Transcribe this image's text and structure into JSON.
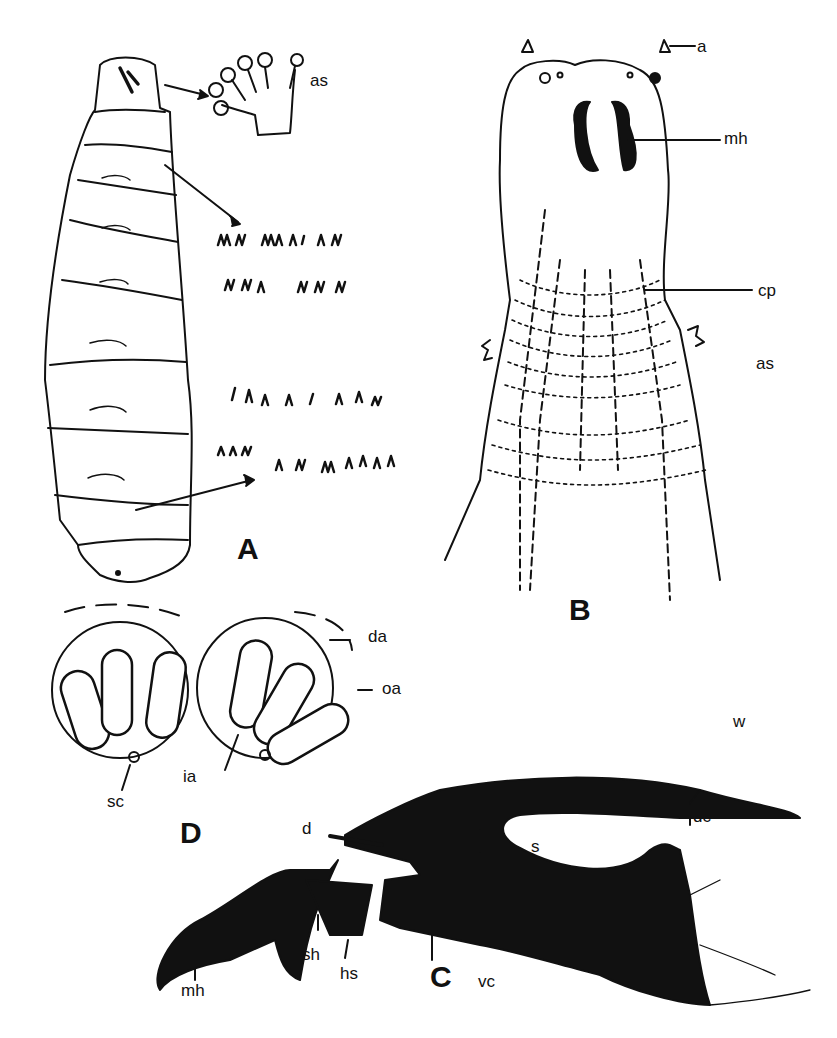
{
  "figure": {
    "panels": [
      {
        "id": "A",
        "letter": "A",
        "subject": "larva, whole body, with anterior spiracle and cuticular spine rows"
      },
      {
        "id": "B",
        "letter": "B",
        "subject": "cephalic segment, ventral view"
      },
      {
        "id": "C",
        "letter": "C",
        "subject": "cephalopharyngeal skeleton, lateral view"
      },
      {
        "id": "D",
        "letter": "D",
        "subject": "posterior spiracles"
      }
    ],
    "labels": {
      "A": {
        "as": "as"
      },
      "B": {
        "a": "a",
        "mh": "mh",
        "cp": "cp",
        "as": "as"
      },
      "C": {
        "d": "d",
        "dc": "dc",
        "s": "s",
        "w_upper": "w",
        "w_lower": "w",
        "ps": "ps",
        "sh": "sh",
        "hs": "hs",
        "mh": "mh",
        "vc": "vc"
      },
      "D": {
        "da": "da",
        "oa": "oa",
        "ia": "ia",
        "sc": "sc"
      }
    },
    "colors": {
      "ink": "#111111",
      "paper": "#ffffff"
    }
  }
}
